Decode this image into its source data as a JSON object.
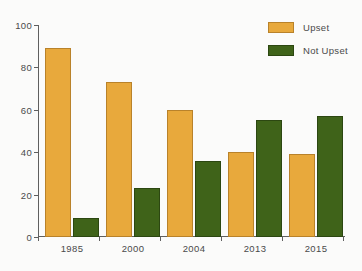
{
  "chart_data": {
    "type": "bar",
    "title": "",
    "subtitle": "",
    "xlabel": "",
    "ylabel": "",
    "categories": [
      "1985",
      "2000",
      "2004",
      "2013",
      "2015"
    ],
    "series": [
      {
        "name": "Upset",
        "color": "#e8a93c",
        "values": [
          89,
          73,
          60,
          40,
          39
        ]
      },
      {
        "name": "Not Upset",
        "color": "#3f6319",
        "values": [
          9,
          23,
          36,
          55,
          57
        ]
      }
    ],
    "ylim": [
      0,
      100
    ],
    "yticks": [
      0,
      20,
      40,
      60,
      80,
      100
    ],
    "ytick_labels": [
      "0",
      "20",
      "40",
      "60",
      "80",
      "100"
    ],
    "grid": false,
    "legend_position": "top-right",
    "legend": [
      "Upset",
      "Not Upset"
    ],
    "annotations": []
  },
  "colors": {
    "background": "#fbfbfa",
    "axis": "#5f5f5f",
    "text": "#4a4a4a",
    "upset_fill": "#e8a93c",
    "upset_stroke": "#b9822a",
    "notupset_fill": "#3f6319",
    "notupset_stroke": "#2c4711"
  }
}
